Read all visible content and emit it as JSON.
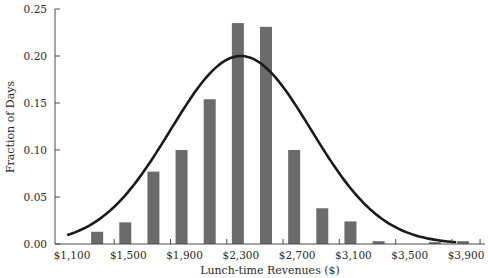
{
  "chart_data": {
    "type": "bar",
    "title": "",
    "xlabel": "Lunch-time Revenues ($)",
    "ylabel": "Fraction of Days",
    "ylim": [
      0,
      0.25
    ],
    "xlim": [
      1100,
      4000
    ],
    "grid": false,
    "legend": "none",
    "y_ticks": [
      0.0,
      0.05,
      0.1,
      0.15,
      0.2,
      0.25
    ],
    "y_tick_labels": [
      "0.00",
      "0.05",
      "0.10",
      "0.15",
      "0.20",
      "0.25"
    ],
    "x_tick_labels": [
      {
        "value": 1100,
        "label": "$1,100"
      },
      {
        "value": 1500,
        "label": "$1,500"
      },
      {
        "value": 1900,
        "label": "$1,900"
      },
      {
        "value": 2300,
        "label": "$2,300"
      },
      {
        "value": 2700,
        "label": "$2,700"
      },
      {
        "value": 3100,
        "label": "$3,100"
      },
      {
        "value": 3500,
        "label": "$3,500"
      },
      {
        "value": 3900,
        "label": "$3,900"
      }
    ],
    "x_tick_marks": [
      1400,
      1800,
      2200,
      2600,
      3000,
      3400,
      3800,
      4000
    ],
    "categories": [
      1300,
      1500,
      1700,
      1900,
      2100,
      2300,
      2500,
      2700,
      2900,
      3100,
      3300,
      3500,
      3700,
      3900
    ],
    "series": [
      {
        "name": "Observed fraction of days",
        "type": "bar",
        "values": [
          0.013,
          0.023,
          0.077,
          0.1,
          0.154,
          0.235,
          0.231,
          0.1,
          0.038,
          0.024,
          0.003,
          0.0,
          0.002,
          0.003
        ]
      },
      {
        "name": "Normal approximation",
        "type": "line",
        "distribution": "normal",
        "mean": 2300,
        "sd": 500,
        "peak": 0.2,
        "x_range": [
          1065,
          3830
        ]
      }
    ]
  }
}
